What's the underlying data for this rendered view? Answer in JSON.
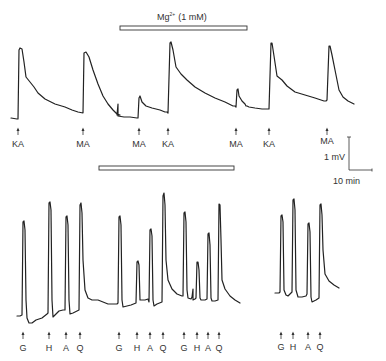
{
  "figure": {
    "top_panel": {
      "treatment_label": "Mg",
      "treatment_superscript": "2+",
      "treatment_conc": "(1 mM)",
      "stimuli": [
        {
          "label": "KA",
          "x": 18
        },
        {
          "label": "MA",
          "x": 83
        },
        {
          "label": "MA",
          "x": 139
        },
        {
          "label": "KA",
          "x": 168
        },
        {
          "label": "MA",
          "x": 236
        },
        {
          "label": "KA",
          "x": 269
        },
        {
          "label": "MA",
          "x": 327
        }
      ]
    },
    "scale_bar": {
      "vertical_label": "1 mV",
      "horizontal_label": "10 min"
    },
    "bottom_panel": {
      "stimuli": [
        {
          "label": "G",
          "x": 23
        },
        {
          "label": "H",
          "x": 49
        },
        {
          "label": "A",
          "x": 66
        },
        {
          "label": "Q",
          "x": 80
        },
        {
          "label": "G",
          "x": 119
        },
        {
          "label": "H",
          "x": 137
        },
        {
          "label": "A",
          "x": 150
        },
        {
          "label": "Q",
          "x": 163
        },
        {
          "label": "G",
          "x": 184
        },
        {
          "label": "H",
          "x": 197
        },
        {
          "label": "A",
          "x": 208
        },
        {
          "label": "Q",
          "x": 219
        },
        {
          "label": "G",
          "x": 281
        },
        {
          "label": "H",
          "x": 293
        },
        {
          "label": "A",
          "x": 308
        },
        {
          "label": "Q",
          "x": 320
        }
      ]
    }
  }
}
